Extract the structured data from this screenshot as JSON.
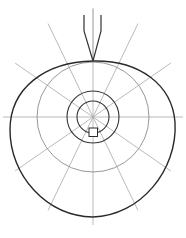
{
  "diagram": {
    "title": "",
    "spoke_count": 12,
    "ring_count": 3,
    "colors": {
      "outline": "#2a2a2a",
      "ring_dark": "#333333",
      "ring_gray": "#8c8c8c",
      "spoke": "#a8a8a8",
      "background": "#ffffff"
    },
    "labels": []
  }
}
